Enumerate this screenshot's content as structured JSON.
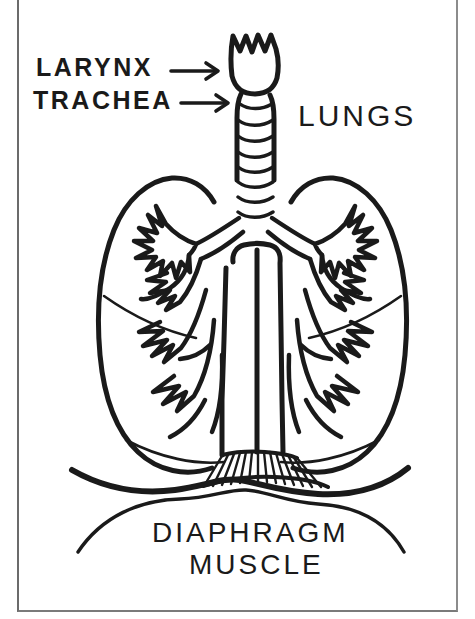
{
  "figure": {
    "style": "hand-drawn black ink line art on white",
    "background_color": "#ffffff",
    "ink_color": "#1a1a1a",
    "frame_color": "#7a7a7a"
  },
  "labels": {
    "larynx": "LARYNX",
    "trachea": "TRACHEA",
    "lungs": "LUNGS",
    "diaphragm": "DIAPHRAGM",
    "muscle": "MUSCLE"
  },
  "pointers": [
    {
      "name": "larynx-arrow",
      "from_label": "LARYNX",
      "points_to": "larynx",
      "direction": "right"
    },
    {
      "name": "trachea-arrow",
      "from_label": "TRACHEA",
      "points_to": "trachea",
      "direction": "right"
    }
  ],
  "anatomy_parts": [
    {
      "name": "larynx",
      "shape": "tulip / crown with three notches at top"
    },
    {
      "name": "trachea",
      "shape": "vertical tube with horizontal cartilage rings"
    },
    {
      "name": "left-lung",
      "shape": "rounded lobe outline"
    },
    {
      "name": "right-lung",
      "shape": "rounded lobe outline"
    },
    {
      "name": "bronchial-tree",
      "shape": "branching antler-like airways inside both lungs"
    },
    {
      "name": "mediastinum-column",
      "shape": "wide central column below trachea bifurcation"
    },
    {
      "name": "diaphragm-striations",
      "shape": "fan of vertical radiating lines"
    },
    {
      "name": "diaphragm-muscle",
      "shape": "wide double curved dome line beneath the lungs"
    }
  ]
}
